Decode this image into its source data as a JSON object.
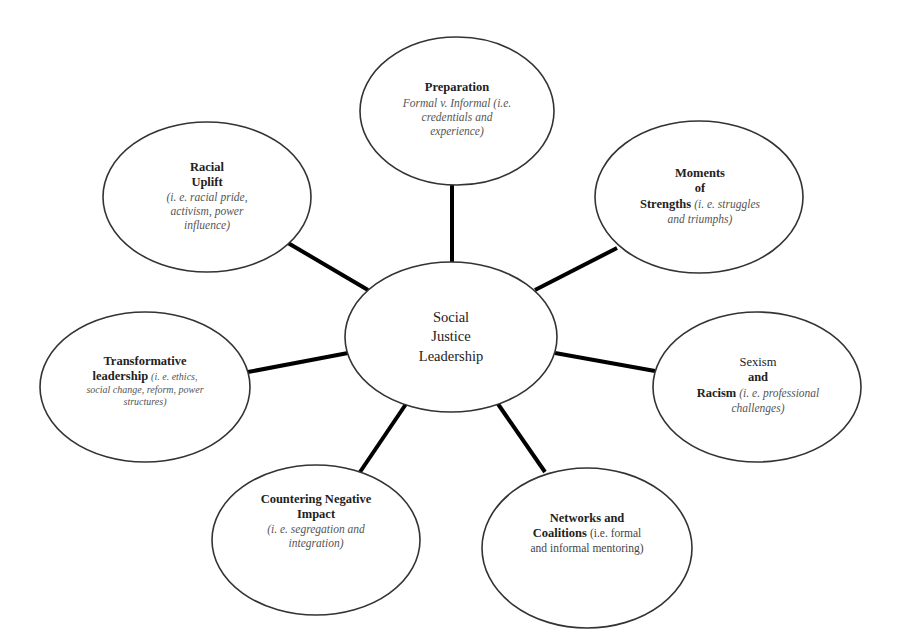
{
  "diagram": {
    "type": "hub-and-spoke concept map",
    "center": {
      "lines": [
        "Social",
        "Justice",
        "Leadership"
      ]
    },
    "nodes": [
      {
        "id": "preparation",
        "title_lines": [
          "Preparation"
        ],
        "description_lines": [
          "Formal v. Informal (i.e.",
          "credentials and",
          "experience)"
        ],
        "position": "top"
      },
      {
        "id": "moments-of-strengths",
        "title_lines": [
          "Moments",
          "of",
          "Strengths"
        ],
        "description_inline": "(i. e. struggles",
        "description_lines": [
          "and triumphs)"
        ],
        "position": "upper-right"
      },
      {
        "id": "sexism-and-racism",
        "title_lines": [
          "Sexism",
          "and",
          "Racism"
        ],
        "description_inline": "(i. e. professional",
        "description_lines": [
          "challenges)"
        ],
        "position": "lower-right"
      },
      {
        "id": "networks-and-coalitions",
        "title_lines": [
          "Networks and",
          "Coalitions"
        ],
        "description_inline": "(i.e. formal",
        "description_lines": [
          "and informal mentoring)"
        ],
        "position": "bottom-right"
      },
      {
        "id": "countering-negative-impact",
        "title_lines": [
          "Countering Negative",
          "Impact"
        ],
        "description_lines": [
          "(i. e. segregation and",
          "integration)"
        ],
        "position": "bottom-left"
      },
      {
        "id": "transformative-leadership",
        "title_lines": [
          "Transformative",
          "leadership"
        ],
        "description_inline": "(i. e. ethics,",
        "description_lines": [
          "social change, reform, power",
          "structures)"
        ],
        "position": "lower-left"
      },
      {
        "id": "racial-uplift",
        "title_lines": [
          "Racial",
          "Uplift"
        ],
        "description_lines": [
          "(i. e. racial pride,",
          "activism, power",
          "influence)"
        ],
        "position": "upper-left"
      }
    ]
  },
  "colors": {
    "background": "#ffffff",
    "connector": "#000000",
    "outline": "#333333",
    "title_text": "#222222",
    "description_text": "#555555"
  }
}
